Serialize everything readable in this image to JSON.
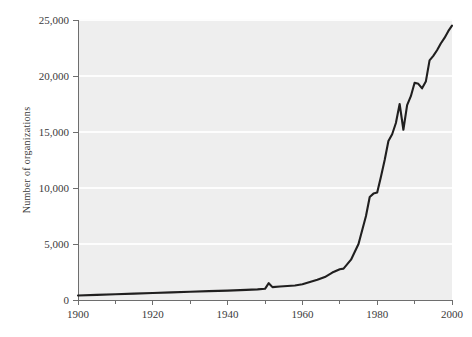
{
  "chart_data": {
    "type": "line",
    "title": "",
    "subtitle": "",
    "xlabel": "",
    "ylabel": "Number of organizations",
    "xlim": [
      1900,
      2000
    ],
    "ylim": [
      0,
      25000
    ],
    "grid": true,
    "legend": null,
    "x_ticks": [
      1900,
      1920,
      1940,
      1960,
      1980,
      2000
    ],
    "x_tick_labels": [
      "1900",
      "1920",
      "1940",
      "1960",
      "1980",
      "2000"
    ],
    "x_minor_ticks": [
      1910,
      1930,
      1950,
      1970,
      1990
    ],
    "y_ticks": [
      0,
      5000,
      10000,
      15000,
      20000,
      25000
    ],
    "y_tick_labels": [
      "0",
      "5,000",
      "10,000",
      "15,000",
      "20,000",
      "25,000"
    ],
    "series": [
      {
        "name": "Number of organizations",
        "color": "#201f1f",
        "x": [
          1900,
          1905,
          1910,
          1915,
          1920,
          1925,
          1930,
          1935,
          1940,
          1945,
          1948,
          1950,
          1951,
          1952,
          1954,
          1956,
          1958,
          1960,
          1962,
          1964,
          1966,
          1968,
          1970,
          1971,
          1973,
          1975,
          1977,
          1978,
          1979,
          1980,
          1981,
          1982,
          1983,
          1984,
          1985,
          1986,
          1987,
          1988,
          1989,
          1990,
          1991,
          1992,
          1993,
          1994,
          1995,
          1996,
          1997,
          1998,
          1999,
          2000
        ],
        "y": [
          400,
          460,
          520,
          570,
          620,
          680,
          740,
          790,
          840,
          900,
          950,
          1000,
          1500,
          1150,
          1200,
          1250,
          1300,
          1400,
          1600,
          1800,
          2050,
          2450,
          2750,
          2800,
          3600,
          5000,
          7500,
          9200,
          9500,
          9600,
          11000,
          12500,
          14200,
          14800,
          15800,
          17500,
          15200,
          17400,
          18200,
          19400,
          19300,
          18900,
          19500,
          21400,
          21800,
          22300,
          22900,
          23400,
          24000,
          24500
        ]
      }
    ]
  },
  "axis": {
    "ylabel": "Number of organizations"
  }
}
